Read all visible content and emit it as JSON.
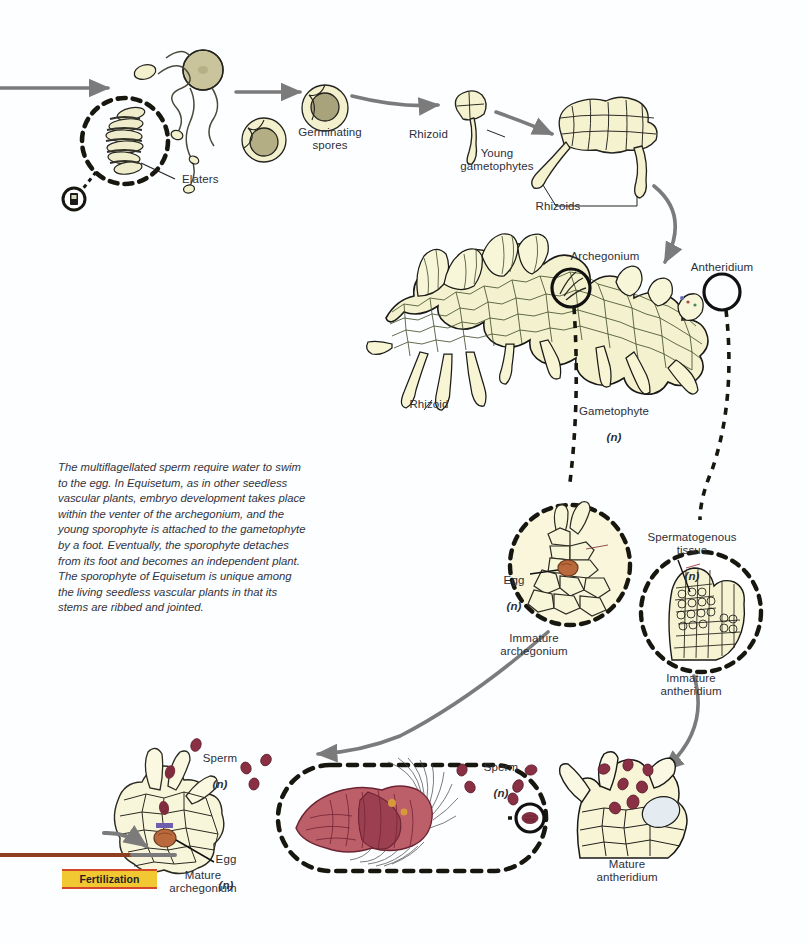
{
  "diagram": {
    "colors": {
      "tissue_fill": "#f5f3cf",
      "tissue_fill_light": "#faf8dd",
      "outline": "#1a1a18",
      "arrow_gray": "#7b7b7b",
      "arrow_brown": "#8d3f20",
      "sperm_red": "#8e3344",
      "sperm_body": "#bf5f68",
      "egg_orange": "#b9693c",
      "badge_fill": "#f2c832",
      "badge_border": "#d4472a",
      "text": "#2e2f38",
      "background": "#fdfeff"
    },
    "caption": "The multiflagellated sperm require water to swim to the egg. In Equisetum, as in other seedless vascular plants, embryo development takes place within the venter of the archegonium, and the young sporophyte is attached to the gametophyte by a foot. Eventually, the sporophyte detaches from its foot and becomes an independent plant. The sporophyte of Equisetum is unique among the living seedless vascular plants in that its stems are ribbed and jointed.",
    "badge": {
      "label": "Fertilization"
    },
    "labels": [
      {
        "id": "elaters",
        "text": "Elaters"
      },
      {
        "id": "germinating-spores",
        "text": "Germinating\nspores"
      },
      {
        "id": "rhizoid-young",
        "text": "Rhizoid"
      },
      {
        "id": "young-gametophytes",
        "text": "Young\ngametophytes"
      },
      {
        "id": "rhizoids",
        "text": "Rhizoids"
      },
      {
        "id": "archegonium",
        "text": "Archegonium"
      },
      {
        "id": "antheridium",
        "text": "Antheridium"
      },
      {
        "id": "rhizoid-mass",
        "text": "Rhizoid"
      },
      {
        "id": "gametophyte",
        "text": "Gametophyte",
        "ploidy": "(n)"
      },
      {
        "id": "egg-immature",
        "text": "Egg",
        "ploidy": "(n)"
      },
      {
        "id": "immature-archegonium",
        "text": "Immature\narchegonium"
      },
      {
        "id": "spermatogenous-tissue",
        "text": "Spermatogenous\ntissue",
        "ploidy": "(n)"
      },
      {
        "id": "immature-antheridium",
        "text": "Immature\nantheridium"
      },
      {
        "id": "sperm-left",
        "text": "Sperm",
        "ploidy": "(n)"
      },
      {
        "id": "egg-mature",
        "text": "Egg",
        "ploidy": "(n)"
      },
      {
        "id": "mature-archegonium",
        "text": "Mature\narchegonium"
      },
      {
        "id": "sperm-right",
        "text": "Sperm",
        "ploidy": "(n)"
      },
      {
        "id": "mature-antheridium",
        "text": "Mature\nantheridium"
      }
    ],
    "icons": {
      "spore_tetrad": "spore-icon",
      "elater_detail": "elater-magnifier-icon",
      "microscope_marker": "microscope-marker-icon",
      "sperm_detail": "sperm-magnifier-icon"
    }
  }
}
